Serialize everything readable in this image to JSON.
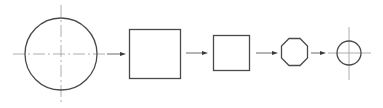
{
  "diagram": {
    "steps": [
      {
        "shape": "circle",
        "label": "",
        "has_center_lines": true
      },
      {
        "shape": "square",
        "label": "",
        "has_center_lines": false
      },
      {
        "shape": "square",
        "label": "",
        "has_center_lines": false
      },
      {
        "shape": "octagon",
        "label": "",
        "has_center_lines": false
      },
      {
        "shape": "circle",
        "label": "",
        "has_center_lines": true
      }
    ],
    "connectors": [
      {
        "from": 0,
        "to": 1,
        "type": "arrow"
      },
      {
        "from": 1,
        "to": 2,
        "type": "arrow"
      },
      {
        "from": 2,
        "to": 3,
        "type": "arrow"
      },
      {
        "from": 3,
        "to": 4,
        "type": "arrow"
      }
    ],
    "colors": {
      "outline": "#4a4a4a",
      "center_line": "#9a9a9a",
      "arrow": "#3a3a3a",
      "background": "#ffffff"
    }
  }
}
